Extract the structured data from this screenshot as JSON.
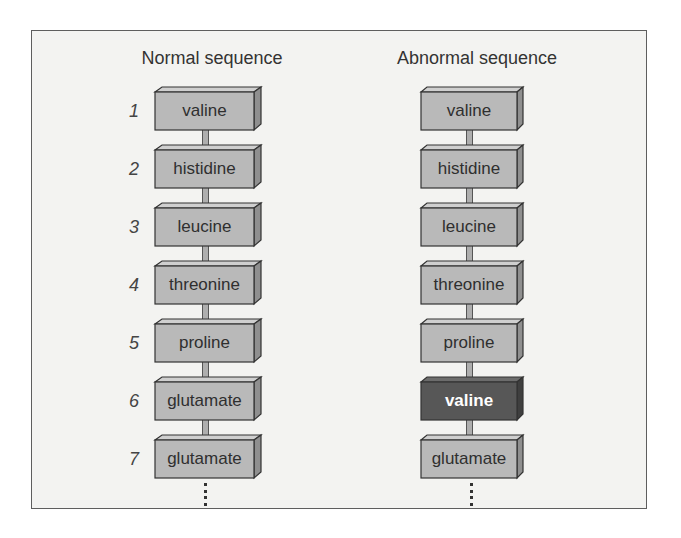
{
  "diagram": {
    "normal": {
      "title": "Normal sequence",
      "items": [
        {
          "n": "1",
          "label": "valine"
        },
        {
          "n": "2",
          "label": "histidine"
        },
        {
          "n": "3",
          "label": "leucine"
        },
        {
          "n": "4",
          "label": "threonine"
        },
        {
          "n": "5",
          "label": "proline"
        },
        {
          "n": "6",
          "label": "glutamate"
        },
        {
          "n": "7",
          "label": "glutamate"
        }
      ]
    },
    "abnormal": {
      "title": "Abnormal sequence",
      "items": [
        {
          "label": "valine"
        },
        {
          "label": "histidine"
        },
        {
          "label": "leucine"
        },
        {
          "label": "threonine"
        },
        {
          "label": "proline"
        },
        {
          "label": "valine",
          "highlight": true
        },
        {
          "label": "glutamate"
        }
      ]
    },
    "colors": {
      "box_front": "#b9b9b9",
      "box_top": "#cfcfcf",
      "box_side": "#8f8f8f",
      "highlight_front": "#575757",
      "highlight_top": "#6c6c6c",
      "highlight_side": "#3f3f3f",
      "outline": "#333333"
    }
  }
}
